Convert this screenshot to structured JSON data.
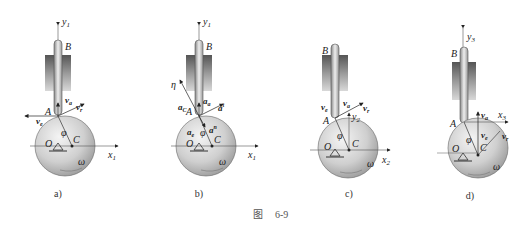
{
  "figure": {
    "caption_prefix": "图",
    "caption_number": "6-9",
    "panels": [
      {
        "id": "a",
        "label": "a)",
        "axis_y": "y",
        "axis_y_sub": "1",
        "axis_x": "x",
        "axis_x_sub": "1",
        "point_A": "A",
        "point_B": "B",
        "point_O": "O",
        "point_C": "C",
        "angle": "φ",
        "omega": "ω",
        "vectors": [
          {
            "name": "v",
            "sub": "a"
          },
          {
            "name": "v",
            "sub": "r"
          },
          {
            "name": "v",
            "sub": "e"
          }
        ]
      },
      {
        "id": "b",
        "label": "b)",
        "axis_y": "y",
        "axis_y_sub": "1",
        "axis_x": "x",
        "axis_x_sub": "1",
        "point_A": "A",
        "point_B": "B",
        "point_O": "O",
        "point_C": "C",
        "angle": "φ",
        "omega": "ω",
        "eta": "η",
        "vectors": [
          {
            "name": "a",
            "sub": "C"
          },
          {
            "name": "a",
            "sub": "a"
          },
          {
            "name": "a",
            "sub": "r",
            "sup": "t"
          },
          {
            "name": "a",
            "sub": "e"
          },
          {
            "name": "a",
            "sub": "r",
            "sup": "n"
          }
        ]
      },
      {
        "id": "c",
        "label": "c)",
        "axis_y": "y",
        "axis_y_sub": "2",
        "axis_x": "x",
        "axis_x_sub": "2",
        "point_A": "A",
        "point_B": "B",
        "point_O": "O",
        "point_C": "C",
        "angle": "φ",
        "omega": "ω",
        "vectors": [
          {
            "name": "v",
            "sub": "e"
          },
          {
            "name": "v",
            "sub": "a"
          },
          {
            "name": "v",
            "sub": "r"
          }
        ]
      },
      {
        "id": "d",
        "label": "d)",
        "axis_y": "y",
        "axis_y_sub": "3",
        "axis_x": "x",
        "axis_x_sub": "3",
        "point_A": "A",
        "point_B": "B",
        "point_O": "O",
        "point_C": "C",
        "angle": "φ",
        "omega": "ω",
        "vectors": [
          {
            "name": "v",
            "sub": "a"
          },
          {
            "name": "v",
            "sub": "e"
          },
          {
            "name": "v",
            "sub": "r"
          }
        ]
      }
    ]
  }
}
